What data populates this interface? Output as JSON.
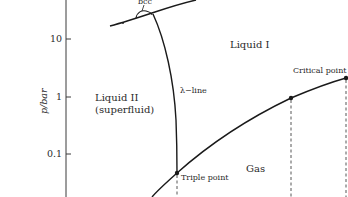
{
  "diagram": {
    "type": "phase-diagram",
    "axis": {
      "y_label": "p/bar",
      "y_scale": "log",
      "y_ticks": [
        {
          "label": "10",
          "value": 10
        },
        {
          "label": "1",
          "value": 1
        },
        {
          "label": "0.1",
          "value": 0.1
        }
      ],
      "x_label": ""
    },
    "regions": {
      "liquid_I": "Liquid I",
      "liquid_II_line1": "Liquid II",
      "liquid_II_line2": "(superfluid)",
      "gas": "Gas",
      "solid_phase_marker": "bcc"
    },
    "lines": {
      "lambda_line": "λ−line",
      "melting_curve": "solid–liquid boundary",
      "vapor_pressure_curve": "liquid–gas boundary"
    },
    "points": {
      "triple_point": "Triple point",
      "critical_point": "Critical point"
    },
    "colors": {
      "line": "#1a1a1a",
      "text": "#2a2a2a",
      "background": "#ffffff"
    }
  }
}
